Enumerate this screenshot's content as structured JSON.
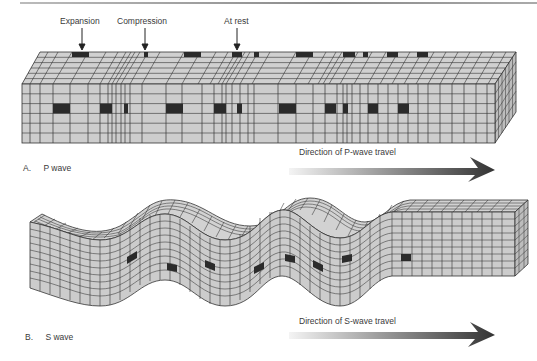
{
  "figure": {
    "panel_a": {
      "caption_letter": "A.",
      "caption_text": "P wave",
      "callouts": [
        {
          "label": "Expansion"
        },
        {
          "label": "Compression"
        },
        {
          "label": "At rest"
        }
      ],
      "direction_label": "Direction of P-wave travel"
    },
    "panel_b": {
      "caption_letter": "B.",
      "caption_text": "S wave",
      "direction_label": "Direction of S-wave travel"
    },
    "colors": {
      "cell_fill": "#c8c8c8",
      "grid_line": "#2a2a2a",
      "marker_cell": "#2b2b2b",
      "arrow_dark": "#3a3a3a",
      "arrow_light": "#f2f2f2",
      "top_rule": "#9a9a9a"
    }
  }
}
